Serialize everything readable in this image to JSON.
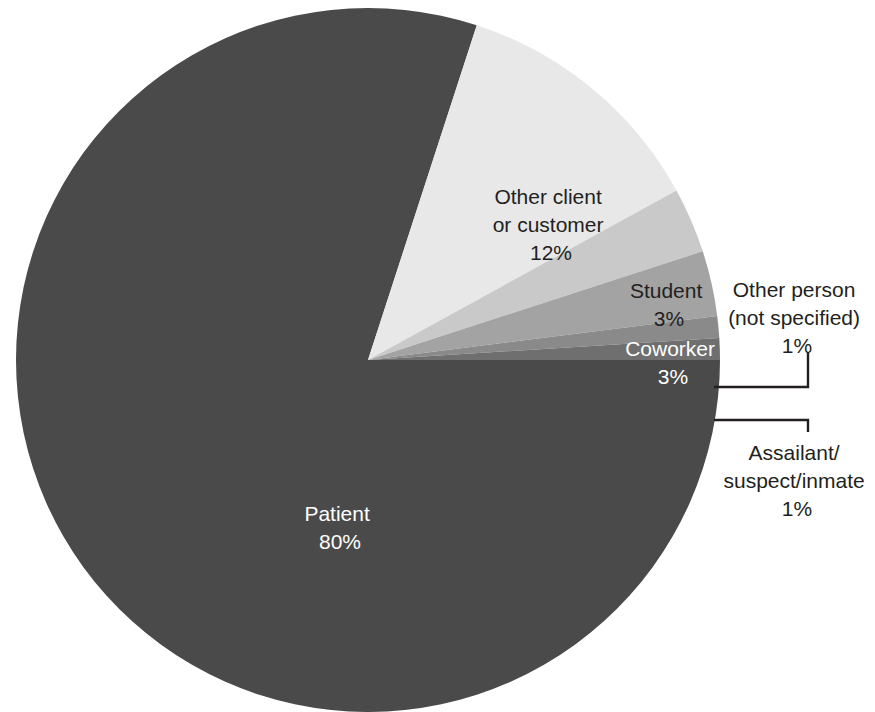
{
  "chart_data": {
    "type": "pie",
    "title": "",
    "subtitle": "",
    "xlabel": "",
    "ylabel": "",
    "legend_position": "none",
    "grid": false,
    "units": "percent",
    "start_angle_deg": 0,
    "direction": "clockwise",
    "center": {
      "x": 368,
      "y": 360
    },
    "radius": 352,
    "categories": [
      "Patient",
      "Other client or customer",
      "Student",
      "Coworker",
      "Other person (not specified)",
      "Assailant/suspect/inmate"
    ],
    "values": [
      80,
      12,
      3,
      3,
      1,
      1
    ],
    "colors": [
      "#4a4a4a",
      "#e8e8e8",
      "#c9c9c9",
      "#a3a3a3",
      "#8a8a8a",
      "#6f6f6f"
    ],
    "slices": [
      {
        "name": "Patient",
        "label_line1": "Patient",
        "label_line2": "80%",
        "value": 80,
        "value_text": "80%",
        "color": "#4a4a4a",
        "text_color": "#ffffff",
        "label_placement": "inside",
        "label_x": 340,
        "label_y": 525
      },
      {
        "name": "Other client or customer",
        "label_line1": "Other client",
        "label_line2": "or customer",
        "label_line3": "12%",
        "value": 12,
        "value_text": "12%",
        "color": "#e8e8e8",
        "text_color": "#231f20",
        "label_placement": "inside",
        "label_x": 551,
        "label_y": 196
      },
      {
        "name": "Student",
        "label_line1": "Student",
        "label_line2": "3%",
        "value": 3,
        "value_text": "3%",
        "color": "#c9c9c9",
        "text_color": "#231f20",
        "label_placement": "inside",
        "label_x": 669,
        "label_y": 292
      },
      {
        "name": "Coworker",
        "label_line1": "Coworker",
        "label_line2": "3%",
        "value": 3,
        "value_text": "3%",
        "color": "#a3a3a3",
        "text_color": "#ffffff",
        "label_placement": "inside",
        "label_x": 672,
        "label_y": 350
      },
      {
        "name": "Other person (not specified)",
        "label_line1": "Other person",
        "label_line2": "(not specified)",
        "label_line3": "1%",
        "value": 1,
        "value_text": "1%",
        "color": "#8a8a8a",
        "text_color": "#231f20",
        "label_placement": "callout",
        "label_x": 797,
        "label_y": 290,
        "leader_from_x": 714,
        "leader_from_y": 387,
        "leader_elbow_x": 808,
        "leader_to_y": 352
      },
      {
        "name": "Assailant/suspect/inmate",
        "label_line1": "Assailant/",
        "label_line2": "suspect/inmate",
        "label_line3": "1%",
        "value": 1,
        "value_text": "1%",
        "color": "#6f6f6f",
        "text_color": "#231f20",
        "label_placement": "callout",
        "label_x": 797,
        "label_y": 457,
        "leader_from_x": 714,
        "leader_from_y": 420,
        "leader_elbow_x": 808,
        "leader_to_y": 432
      }
    ]
  }
}
